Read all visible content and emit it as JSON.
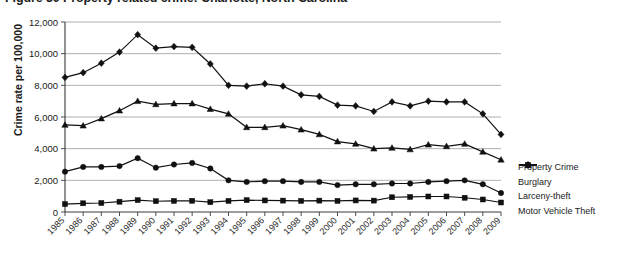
{
  "chart_data": {
    "type": "line",
    "title": "Figure 30  Property related crime: Charlotte, North Carolina",
    "xlabel": "",
    "ylabel": "Crime rate per 100,000",
    "ylim": [
      0,
      12000
    ],
    "ytick_step": 2000,
    "ytick_labels": [
      "0",
      "2,000",
      "4,000",
      "6,000",
      "8,000",
      "10,000",
      "12,000"
    ],
    "grid": true,
    "legend_position": "right",
    "categories": [
      "1985",
      "1986",
      "1987",
      "1988",
      "1989",
      "1990",
      "1991",
      "1992",
      "1993",
      "1994",
      "1995",
      "1996",
      "1997",
      "1998",
      "1999",
      "2000",
      "2001",
      "2002",
      "2003",
      "2004",
      "2005",
      "2006",
      "2007",
      "2008",
      "2009"
    ],
    "series": [
      {
        "name": "Property Crime",
        "marker": "diamond",
        "color": "#111111",
        "values": [
          8500,
          8800,
          9400,
          10100,
          11200,
          10350,
          10450,
          10400,
          9350,
          8000,
          7950,
          8100,
          7950,
          7400,
          7300,
          6750,
          6700,
          6350,
          6950,
          6700,
          7000,
          6950,
          6950,
          6200,
          4900
        ]
      },
      {
        "name": "Burglary",
        "marker": "circle",
        "color": "#111111",
        "values": [
          2550,
          2850,
          2850,
          2900,
          3400,
          2800,
          3000,
          3100,
          2750,
          2000,
          1900,
          1950,
          1950,
          1900,
          1900,
          1700,
          1750,
          1750,
          1800,
          1800,
          1900,
          1950,
          2000,
          1750,
          1200
        ]
      },
      {
        "name": "Larceny-theft",
        "marker": "triangle",
        "color": "#111111",
        "values": [
          5500,
          5450,
          5900,
          6400,
          7000,
          6800,
          6850,
          6850,
          6500,
          6200,
          5350,
          5350,
          5450,
          5200,
          4900,
          4450,
          4300,
          4000,
          4050,
          3950,
          4250,
          4150,
          4300,
          3800,
          3300
        ]
      },
      {
        "name": "Motor Vehicle Theft",
        "marker": "square",
        "color": "#111111",
        "values": [
          500,
          550,
          570,
          650,
          750,
          680,
          700,
          710,
          620,
          700,
          750,
          730,
          720,
          700,
          720,
          700,
          730,
          720,
          930,
          950,
          980,
          980,
          900,
          790,
          600
        ]
      }
    ]
  }
}
